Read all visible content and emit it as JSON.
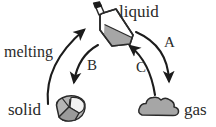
{
  "figure": {
    "type": "phase-change-cycle-diagram",
    "background_color": "#ffffff",
    "ink_color": "#2a2a2a",
    "fill_gray": "#a6a6a6",
    "fill_light": "#d9d9d9"
  },
  "states": {
    "liquid": {
      "label": "liquid",
      "icon": "tilted-bottle-with-liquid"
    },
    "solid": {
      "label": "solid",
      "icon": "faceted-rock-crystal"
    },
    "gas": {
      "label": "gas",
      "icon": "gas-cloud"
    }
  },
  "transitions": [
    {
      "id": "melting",
      "label": "melting",
      "from": "solid",
      "to": "liquid"
    },
    {
      "id": "A",
      "label": "A",
      "from": "liquid",
      "to": "gas"
    },
    {
      "id": "B",
      "label": "B",
      "from": "liquid",
      "to": "solid"
    },
    {
      "id": "C",
      "label": "C",
      "from": "gas",
      "to": "liquid"
    }
  ]
}
